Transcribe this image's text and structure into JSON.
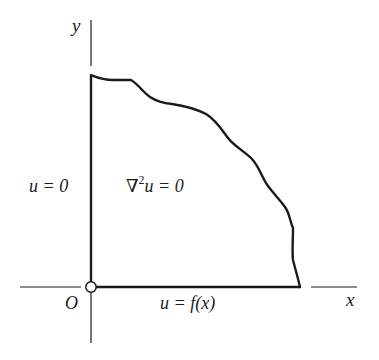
{
  "diagram": {
    "type": "boundary-value-problem",
    "axes": {
      "x_label": "x",
      "y_label": "y",
      "origin_label": "O"
    },
    "labels": {
      "left_boundary": "u = 0",
      "interior_equation_nabla": "∇",
      "interior_equation_sup": "2",
      "interior_equation_rest": "u = 0",
      "bottom_boundary": "u = f(x)"
    },
    "colors": {
      "stroke": "#1a1a1a",
      "background": "#ffffff"
    }
  }
}
